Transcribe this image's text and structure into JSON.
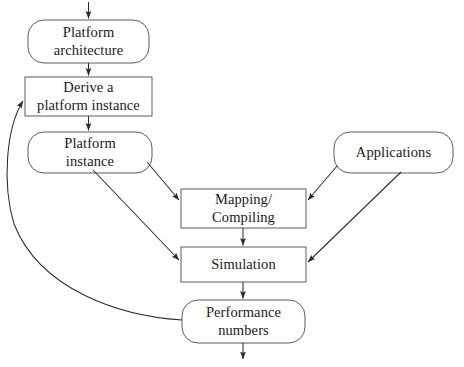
{
  "diagram": {
    "background_color": "#ffffff",
    "stroke_color": "#3a3a3a",
    "text_color": "#1a1a1a",
    "nodes": [
      {
        "id": "platform-architecture",
        "shape": "rounded-rectangle",
        "lines": [
          "Platform",
          "architecture"
        ],
        "x": 28,
        "y": 20,
        "width": 121,
        "height": 43
      },
      {
        "id": "derive-platform-instance",
        "shape": "rectangle",
        "lines": [
          "Derive a",
          "platform instance"
        ],
        "x": 25,
        "y": 77,
        "width": 127,
        "height": 39
      },
      {
        "id": "platform-instance",
        "shape": "rounded-rectangle",
        "lines": [
          "Platform",
          "instance"
        ],
        "x": 28,
        "y": 132,
        "width": 124,
        "height": 41
      },
      {
        "id": "mapping-compiling",
        "shape": "rectangle",
        "lines": [
          "Mapping/",
          "Compiling"
        ],
        "x": 181,
        "y": 189,
        "width": 125,
        "height": 39
      },
      {
        "id": "simulation",
        "shape": "rectangle",
        "lines": [
          "Simulation"
        ],
        "x": 181,
        "y": 247,
        "width": 125,
        "height": 35
      },
      {
        "id": "applications",
        "shape": "rounded-rectangle",
        "lines": [
          "Applications"
        ],
        "x": 334,
        "y": 132,
        "width": 119,
        "height": 41
      },
      {
        "id": "performance-numbers",
        "shape": "rounded-rectangle",
        "lines": [
          "Performance",
          "numbers"
        ],
        "x": 182,
        "y": 300,
        "width": 123,
        "height": 43
      }
    ],
    "edges": [
      {
        "id": "entry-to-platform-architecture",
        "from": "entry-point",
        "to": "platform-architecture",
        "style": "straight-arrow"
      },
      {
        "id": "platform-architecture-to-derive",
        "from": "platform-architecture",
        "to": "derive-platform-instance",
        "style": "straight-arrow"
      },
      {
        "id": "derive-to-platform-instance",
        "from": "derive-platform-instance",
        "to": "platform-instance",
        "style": "straight-arrow"
      },
      {
        "id": "platform-instance-to-mapping",
        "from": "platform-instance",
        "to": "mapping-compiling",
        "style": "diagonal-arrow"
      },
      {
        "id": "platform-instance-to-simulation",
        "from": "platform-instance",
        "to": "simulation",
        "style": "diagonal-arrow"
      },
      {
        "id": "applications-to-mapping",
        "from": "applications",
        "to": "mapping-compiling",
        "style": "diagonal-arrow"
      },
      {
        "id": "applications-to-simulation",
        "from": "applications",
        "to": "simulation",
        "style": "diagonal-arrow"
      },
      {
        "id": "mapping-to-simulation",
        "from": "mapping-compiling",
        "to": "simulation",
        "style": "straight-arrow"
      },
      {
        "id": "simulation-to-performance-numbers",
        "from": "simulation",
        "to": "performance-numbers",
        "style": "straight-arrow"
      },
      {
        "id": "performance-numbers-feedback-to-derive",
        "from": "performance-numbers",
        "to": "derive-platform-instance",
        "style": "curved-feedback-arrow"
      },
      {
        "id": "performance-numbers-to-exit",
        "from": "performance-numbers",
        "to": "exit-point",
        "style": "straight-arrow"
      }
    ]
  }
}
